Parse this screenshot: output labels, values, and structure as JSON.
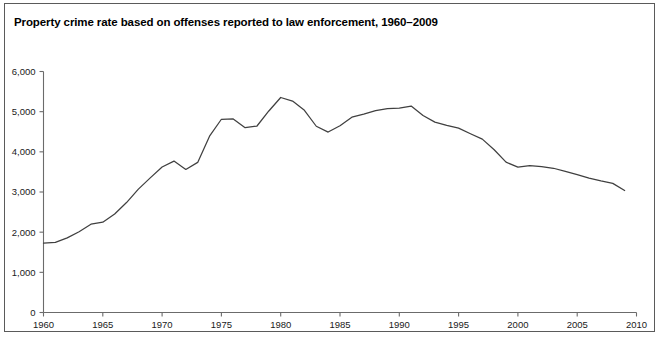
{
  "chart_data": {
    "type": "line",
    "title": "Property crime rate based on offenses reported to law enforcement, 1960–2009",
    "xlabel": "",
    "ylabel": "",
    "xlim": [
      1960,
      2010
    ],
    "ylim": [
      0,
      6000
    ],
    "grid": false,
    "legend": null,
    "line_color": "#404040",
    "axis_color": "#6b6b6b",
    "xticks": [
      1960,
      1965,
      1970,
      1975,
      1980,
      1985,
      1990,
      1995,
      2000,
      2005,
      2010
    ],
    "xtick_labels": [
      "1960",
      "1965",
      "1970",
      "1975",
      "1980",
      "1985",
      "1990",
      "1995",
      "2000",
      "2005",
      "2010"
    ],
    "yticks": [
      0,
      1000,
      2000,
      3000,
      4000,
      5000,
      6000
    ],
    "ytick_labels": [
      "0",
      "1,000",
      "2,000",
      "3,000",
      "4,000",
      "5,000",
      "6,000"
    ],
    "series": [
      {
        "name": "Property crime rate per 100,000",
        "x": [
          1960,
          1961,
          1962,
          1963,
          1964,
          1965,
          1966,
          1967,
          1968,
          1969,
          1970,
          1971,
          1972,
          1973,
          1974,
          1975,
          1976,
          1977,
          1978,
          1979,
          1980,
          1981,
          1982,
          1983,
          1984,
          1985,
          1986,
          1987,
          1988,
          1989,
          1990,
          1991,
          1992,
          1993,
          1994,
          1995,
          1996,
          1997,
          1998,
          1999,
          2000,
          2001,
          2002,
          2003,
          2004,
          2005,
          2006,
          2007,
          2008,
          2009
        ],
        "values": [
          1726,
          1747,
          1857,
          2012,
          2198,
          2249,
          2451,
          2737,
          3072,
          3351,
          3621,
          3769,
          3561,
          3737,
          4389,
          4811,
          4820,
          4602,
          4643,
          5017,
          5353,
          5264,
          5033,
          4637,
          4492,
          4651,
          4863,
          4940,
          5027,
          5077,
          5088,
          5140,
          4903,
          4740,
          4660,
          4591,
          4451,
          4316,
          4053,
          3744,
          3618,
          3658,
          3631,
          3591,
          3514,
          3432,
          3346,
          3276,
          3215,
          3036
        ]
      }
    ]
  },
  "figure": {
    "background_color": "#ffffff",
    "border_color": "#5a5a5a"
  }
}
